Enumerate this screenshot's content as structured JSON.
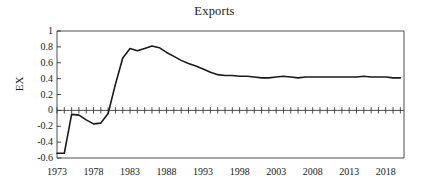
{
  "chart_data": {
    "type": "line",
    "title": "Exports",
    "xlabel": "",
    "ylabel": "EX",
    "xlim": [
      1973,
      2020.5
    ],
    "ylim": [
      -0.6,
      1.0
    ],
    "grid": false,
    "legend": null,
    "zero_line": 0,
    "y_ticks": [
      1,
      0.8,
      0.6,
      0.4,
      0.2,
      0,
      -0.2,
      -0.4,
      -0.6
    ],
    "y_tick_labels": [
      "1",
      "0.8",
      "0.6",
      "0.4",
      "0.2",
      "0",
      "-0.2",
      "-0.4",
      "-0.6"
    ],
    "x_ticks": [
      1973,
      1978,
      1983,
      1988,
      1993,
      1998,
      2003,
      2008,
      2013,
      2018
    ],
    "x_tick_labels": [
      "1973",
      "1978",
      "1983",
      "1988",
      "1993",
      "1998",
      "2003",
      "2008",
      "2013",
      "2018"
    ],
    "x_minor_tick_step": 1,
    "line_color": "#1a1a1a",
    "line_width": 1.6,
    "x": [
      1973,
      1974,
      1975,
      1976,
      1977,
      1978,
      1979,
      1980,
      1981,
      1982,
      1983,
      1984,
      1985,
      1986,
      1987,
      1988,
      1989,
      1990,
      1991,
      1992,
      1993,
      1994,
      1995,
      1996,
      1997,
      1998,
      1999,
      2000,
      2001,
      2002,
      2003,
      2004,
      2005,
      2006,
      2007,
      2008,
      2009,
      2010,
      2011,
      2012,
      2013,
      2014,
      2015,
      2016,
      2017,
      2018,
      2019,
      2020
    ],
    "series": [
      {
        "name": "EX",
        "values": [
          -0.54,
          -0.54,
          -0.05,
          -0.06,
          -0.12,
          -0.17,
          -0.16,
          -0.04,
          0.33,
          0.66,
          0.78,
          0.75,
          0.78,
          0.81,
          0.79,
          0.73,
          0.68,
          0.63,
          0.59,
          0.56,
          0.52,
          0.48,
          0.45,
          0.44,
          0.44,
          0.43,
          0.43,
          0.42,
          0.41,
          0.41,
          0.42,
          0.43,
          0.42,
          0.41,
          0.42,
          0.42,
          0.42,
          0.42,
          0.42,
          0.42,
          0.42,
          0.42,
          0.43,
          0.42,
          0.42,
          0.42,
          0.41,
          0.41
        ]
      }
    ]
  }
}
